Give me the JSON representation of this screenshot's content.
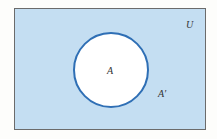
{
  "diagram": {
    "type": "venn",
    "universe": {
      "label": "U",
      "fill": "#c4def2",
      "stroke": "#6b6b6b"
    },
    "set": {
      "label": "A",
      "fill": "#ffffff",
      "stroke": "#2f6fb5"
    },
    "complement": {
      "label": "A′"
    }
  }
}
